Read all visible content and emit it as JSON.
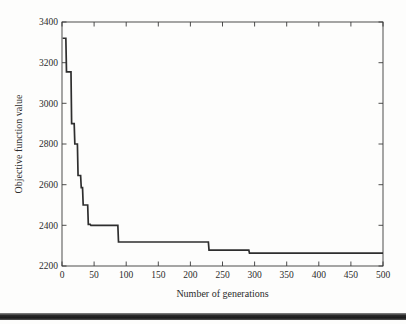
{
  "figure": {
    "background_color": "#fdfdfc",
    "axis_color": "#3a3a3a",
    "line_color": "#2e2e2e",
    "page_edge_bar_color": "#1a1a1a"
  },
  "chart_data": {
    "type": "line",
    "title": "",
    "xlabel": "Number of generations",
    "ylabel": "Objective function value",
    "xlim": [
      0,
      500
    ],
    "ylim": [
      2200,
      3400
    ],
    "xticks": [
      0,
      50,
      100,
      150,
      200,
      250,
      300,
      350,
      400,
      450,
      500
    ],
    "xtick_labels": [
      "0",
      "50",
      "100",
      "150",
      "200",
      "250",
      "300",
      "350",
      "400",
      "450",
      "500"
    ],
    "yticks": [
      2200,
      2400,
      2600,
      2800,
      3000,
      3200,
      3400
    ],
    "ytick_labels": [
      "2200",
      "2400",
      "2600",
      "2800",
      "3000",
      "3200",
      "3400"
    ],
    "grid": false,
    "legend": null,
    "ticks_all_sides": true,
    "series": [
      {
        "name": "Best objective function value",
        "style": "step-post",
        "x": [
          1,
          6,
          7,
          14,
          15,
          19,
          20,
          24,
          25,
          29,
          30,
          32,
          33,
          35,
          36,
          40,
          41,
          44,
          45,
          87,
          88,
          228,
          229,
          291,
          292,
          500
        ],
        "y": [
          3320,
          3320,
          3155,
          3155,
          2900,
          2900,
          2800,
          2800,
          2645,
          2645,
          2585,
          2585,
          2500,
          2500,
          2500,
          2500,
          2405,
          2405,
          2400,
          2400,
          2318,
          2318,
          2278,
          2278,
          2263,
          2263
        ]
      }
    ],
    "step_points": [
      {
        "generation": 1,
        "value": 3320
      },
      {
        "generation": 7,
        "value": 3155
      },
      {
        "generation": 15,
        "value": 2900
      },
      {
        "generation": 20,
        "value": 2800
      },
      {
        "generation": 25,
        "value": 2645
      },
      {
        "generation": 30,
        "value": 2585
      },
      {
        "generation": 33,
        "value": 2500
      },
      {
        "generation": 41,
        "value": 2405
      },
      {
        "generation": 45,
        "value": 2400
      },
      {
        "generation": 88,
        "value": 2318
      },
      {
        "generation": 229,
        "value": 2278
      },
      {
        "generation": 292,
        "value": 2263
      }
    ]
  }
}
